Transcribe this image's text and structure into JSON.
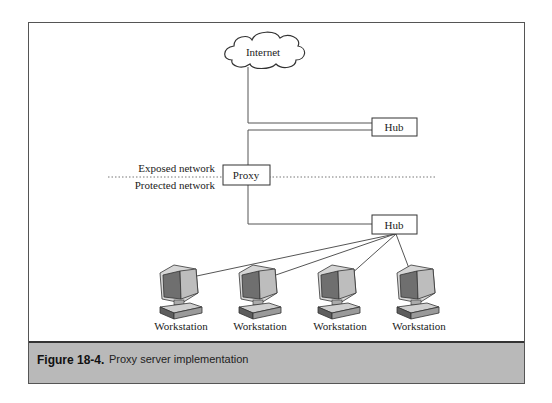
{
  "diagram": {
    "nodes": {
      "internet": {
        "label": "Internet",
        "shape": "cloud"
      },
      "hub_top": {
        "label": "Hub",
        "shape": "box"
      },
      "proxy": {
        "label": "Proxy",
        "shape": "box"
      },
      "hub_bottom": {
        "label": "Hub",
        "shape": "box"
      },
      "workstations": [
        {
          "label": "Workstation"
        },
        {
          "label": "Workstation"
        },
        {
          "label": "Workstation"
        },
        {
          "label": "Workstation"
        }
      ]
    },
    "zones": {
      "exposed": "Exposed network",
      "protected": "Protected network"
    },
    "edges": [
      [
        "internet",
        "hub_top"
      ],
      [
        "hub_top",
        "proxy"
      ],
      [
        "proxy",
        "hub_bottom"
      ],
      [
        "hub_bottom",
        "workstation_1"
      ],
      [
        "hub_bottom",
        "workstation_2"
      ],
      [
        "hub_bottom",
        "workstation_3"
      ],
      [
        "hub_bottom",
        "workstation_4"
      ]
    ]
  },
  "caption": {
    "label": "Figure 18-4.",
    "text": "Proxy server implementation"
  },
  "colors": {
    "caption_band": "#b9b9b9",
    "frame": "#555555",
    "monitor_screen": "#6f6f6f",
    "monitor_body": "#cfcfcf"
  }
}
